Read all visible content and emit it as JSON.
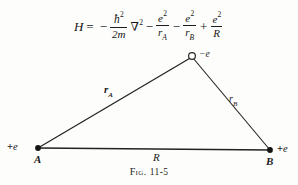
{
  "figure": {
    "caption_prefix": "Fig.",
    "caption_number": "11-5"
  },
  "equation": {
    "full_text": "H = - (h-bar^2 / 2m) nabla^2 - e^2/r_A - e^2/r_B + e^2/R",
    "lhs": "H",
    "equals": "=",
    "minus1": "−",
    "term1": {
      "numerator_symbol": "ħ",
      "numerator_exponent": "2",
      "denominator": "2m",
      "operator": "∇",
      "operator_exponent": "2"
    },
    "minus2": "−",
    "term2": {
      "numerator_symbol": "e",
      "numerator_exponent": "2",
      "denominator_symbol": "r",
      "denominator_subscript": "A"
    },
    "minus3": "−",
    "term3": {
      "numerator_symbol": "e",
      "numerator_exponent": "2",
      "denominator_symbol": "r",
      "denominator_subscript": "B"
    },
    "plus": "+",
    "term4": {
      "numerator_symbol": "e",
      "numerator_exponent": "2",
      "denominator_symbol": "R"
    }
  },
  "diagram": {
    "type": "triangle",
    "nucleus_a": {
      "label": "A",
      "charge_sign": "+",
      "charge_symbol": "e",
      "x": 38,
      "y": 104
    },
    "nucleus_b": {
      "label": "B",
      "charge_sign": "+",
      "charge_symbol": "e",
      "x": 270,
      "y": 106
    },
    "electron": {
      "charge_sign": "−",
      "charge_symbol": "e",
      "x": 192,
      "y": 12
    },
    "edges": {
      "r_a": {
        "symbol": "r",
        "subscript": "A"
      },
      "r_b": {
        "symbol": "r",
        "subscript": "B"
      },
      "internuclear": {
        "symbol": "R"
      }
    }
  },
  "colors": {
    "background": "#fdfdfb",
    "ink": "#1d1d1d",
    "line": "#222222"
  }
}
